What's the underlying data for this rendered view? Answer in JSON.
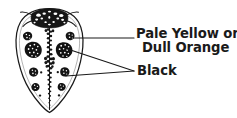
{
  "figure": {
    "colors": {
      "ink": "#1a1a1a",
      "background": "#ffffff",
      "body_fill": "#ffffff",
      "marking_fill": "#111111"
    }
  },
  "labels": {
    "pale_yellow_line1": "Pale Yellow or",
    "pale_yellow_line2": "Dull Orange",
    "black": "Black"
  },
  "callouts": [
    {
      "name": "pale-yellow-callout",
      "target": "elytron-background",
      "line": {
        "x1": 73,
        "y1": 38,
        "x2": 134,
        "y2": 38
      }
    },
    {
      "name": "black-spot-callout-upper",
      "target": "elytron-spot",
      "line": {
        "x1": 67,
        "y1": 49,
        "x2": 134,
        "y2": 71
      }
    },
    {
      "name": "black-spot-callout-lower",
      "target": "elytron-spot",
      "line": {
        "x1": 66,
        "y1": 76,
        "x2": 134,
        "y2": 71
      }
    }
  ],
  "beetle": {
    "name": "beetle-body",
    "outline_color": "#1a1a1a",
    "parts": [
      {
        "name": "pronotum",
        "fill": "black"
      },
      {
        "name": "elytra",
        "fill": "pale yellow or dull orange"
      },
      {
        "name": "midline-suture",
        "fill": "black"
      },
      {
        "name": "spots",
        "fill": "black",
        "count": 12
      },
      {
        "name": "antennae",
        "fill": "black"
      }
    ]
  }
}
